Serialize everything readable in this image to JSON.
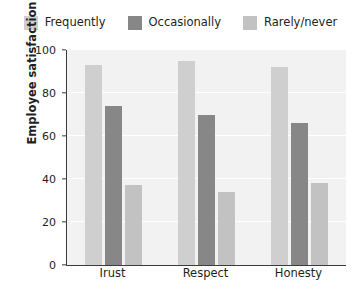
{
  "chart_data": {
    "type": "bar",
    "title": "",
    "xlabel": "",
    "ylabel": "Employee satisfaction (%)",
    "ylim": [
      0,
      100
    ],
    "yticks": [
      0,
      20,
      40,
      60,
      80,
      100
    ],
    "grid": true,
    "legend_position": "top",
    "categories": [
      "Irust",
      "Respect",
      "Honesty"
    ],
    "series": [
      {
        "name": "Frequently",
        "color": "#cfcfcf",
        "values": [
          93,
          95,
          92
        ]
      },
      {
        "name": "Occasionally",
        "color": "#878787",
        "values": [
          74,
          70,
          66
        ]
      },
      {
        "name": "Rarely/never",
        "color": "#c2c2c2",
        "values": [
          37,
          34,
          38
        ]
      }
    ]
  },
  "axes": {
    "y_title": "Employee satisfaction (%)",
    "y_tick_labels": [
      "0",
      "20",
      "40",
      "60",
      "80",
      "100"
    ],
    "x_tick_labels": [
      "Irust",
      "Respect",
      "Honesty"
    ]
  },
  "legend": {
    "items": [
      {
        "label": "Frequently",
        "swatch": "legend-swatch-frequently"
      },
      {
        "label": "Occasionally",
        "swatch": "legend-swatch-occasionally"
      },
      {
        "label": "Rarely/never",
        "swatch": "legend-swatch-rarely-never"
      }
    ]
  },
  "style": {
    "plot_background": "#f2f2f2",
    "gridline_color": "#ffffff",
    "axis_color": "#3b3b3b",
    "text_color": "#231f20"
  }
}
